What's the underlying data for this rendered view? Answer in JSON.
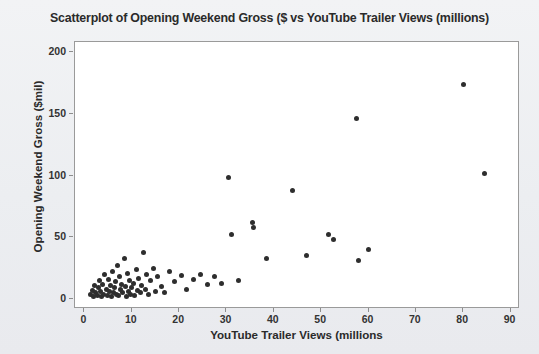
{
  "chart_data": {
    "type": "scatter",
    "title": "Scatterplot of Opening Weekend Gross ($ vs YouTube Trailer Views (millions)",
    "xlabel": "YouTube Trailer Views (millions",
    "ylabel": "Opening Weekend Gross ($mil)",
    "xlim": [
      -2,
      92
    ],
    "ylim": [
      -8,
      208
    ],
    "xticks": [
      0,
      10,
      20,
      30,
      40,
      50,
      60,
      70,
      80,
      90
    ],
    "yticks": [
      0,
      50,
      100,
      150,
      200
    ],
    "grid": false,
    "legend": null,
    "marker_color": "#2e2e2e",
    "plot_bg": "#ffffff",
    "figure_bg": "#eff0f3",
    "points": [
      [
        1.2,
        4
      ],
      [
        1.6,
        7
      ],
      [
        2.0,
        2
      ],
      [
        2.2,
        11
      ],
      [
        2.4,
        5
      ],
      [
        2.8,
        3
      ],
      [
        3.0,
        9
      ],
      [
        3.2,
        15
      ],
      [
        3.4,
        6
      ],
      [
        3.6,
        2
      ],
      [
        3.9,
        12
      ],
      [
        4.1,
        4
      ],
      [
        4.3,
        20
      ],
      [
        4.6,
        8
      ],
      [
        4.8,
        3
      ],
      [
        5.0,
        16
      ],
      [
        5.2,
        6
      ],
      [
        5.5,
        11
      ],
      [
        5.7,
        2
      ],
      [
        5.9,
        22
      ],
      [
        6.1,
        5
      ],
      [
        6.4,
        9
      ],
      [
        6.6,
        14
      ],
      [
        6.8,
        4
      ],
      [
        7.0,
        27
      ],
      [
        7.2,
        3
      ],
      [
        7.5,
        18
      ],
      [
        7.7,
        8
      ],
      [
        7.9,
        12
      ],
      [
        8.1,
        5
      ],
      [
        8.4,
        33
      ],
      [
        8.6,
        10
      ],
      [
        8.8,
        2
      ],
      [
        9.0,
        21
      ],
      [
        9.3,
        6
      ],
      [
        9.5,
        15
      ],
      [
        9.8,
        4
      ],
      [
        10.0,
        9
      ],
      [
        10.3,
        13
      ],
      [
        10.6,
        3
      ],
      [
        10.9,
        24
      ],
      [
        11.2,
        7
      ],
      [
        11.5,
        17
      ],
      [
        11.8,
        5
      ],
      [
        12.1,
        11
      ],
      [
        12.5,
        38
      ],
      [
        12.8,
        8
      ],
      [
        13.2,
        20
      ],
      [
        13.6,
        4
      ],
      [
        14.0,
        15
      ],
      [
        14.5,
        25
      ],
      [
        15.0,
        6
      ],
      [
        15.5,
        18
      ],
      [
        16.2,
        10
      ],
      [
        17.0,
        5
      ],
      [
        18.0,
        22
      ],
      [
        19.0,
        14
      ],
      [
        20.5,
        19
      ],
      [
        21.5,
        8
      ],
      [
        23.0,
        16
      ],
      [
        24.5,
        20
      ],
      [
        26.0,
        12
      ],
      [
        27.5,
        18
      ],
      [
        29.0,
        13
      ],
      [
        30.5,
        98
      ],
      [
        31.0,
        52
      ],
      [
        32.5,
        15
      ],
      [
        35.5,
        62
      ],
      [
        35.8,
        58
      ],
      [
        38.5,
        33
      ],
      [
        44.0,
        88
      ],
      [
        47.0,
        35
      ],
      [
        51.5,
        52
      ],
      [
        52.5,
        48
      ],
      [
        57.5,
        146
      ],
      [
        57.8,
        31
      ],
      [
        60.0,
        40
      ],
      [
        80.0,
        174
      ],
      [
        84.5,
        102
      ]
    ]
  }
}
